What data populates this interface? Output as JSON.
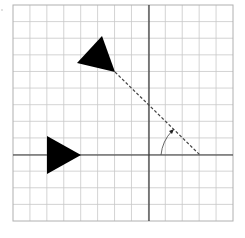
{
  "diagram": {
    "title": "",
    "grid": {
      "x0": 13,
      "y0": 5,
      "x1": 233,
      "y1": 221,
      "spacing": 16.9,
      "cols": 13,
      "rows": 13,
      "line_color": "#c8c8c8",
      "border_color": "#b0b0b0"
    },
    "axes": {
      "origin": {
        "x": 149,
        "y": 155
      },
      "color": "#333333"
    },
    "shapes": [
      {
        "name": "original-triangle",
        "points": "47,136 47,174 81,155",
        "fill": "#000000"
      },
      {
        "name": "rotated-triangle",
        "points": "102,36 77,63 115,72",
        "fill": "#000000"
      }
    ],
    "rotation": {
      "center": {
        "x": 200,
        "y": 155
      },
      "dashed_line": {
        "x1": 115,
        "y1": 72,
        "x2": 200,
        "y2": 155
      },
      "arc": {
        "start": {
          "x": 161,
          "y": 155
        },
        "end": {
          "x": 172,
          "y": 131
        }
      },
      "color": "#444444"
    }
  }
}
